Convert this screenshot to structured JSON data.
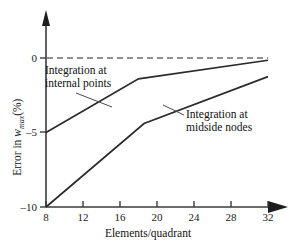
{
  "chart_data": {
    "type": "line",
    "title": "",
    "xlabel": "Elements/quadrant",
    "ylabel": "Error in w_max (%)",
    "xlim": [
      8,
      32
    ],
    "ylim": [
      -10,
      0.6
    ],
    "grid": false,
    "legend": "annotations",
    "x_ticks": [
      8,
      12,
      16,
      20,
      24,
      28,
      32
    ],
    "x_tick_labels": [
      "8",
      "12",
      "16",
      "20",
      "24",
      "28",
      "32"
    ],
    "y_ticks": [
      0,
      -5,
      -10
    ],
    "y_tick_labels": [
      "0",
      "–5",
      "–10"
    ],
    "reference_line": {
      "name": "zero-error-line",
      "y": 0,
      "style": "dashed",
      "x_from": 8,
      "x_to": 32
    },
    "series": [
      {
        "name": "Integration at internal points",
        "x": [
          8,
          18,
          32
        ],
        "y": [
          -5.0,
          -1.4,
          -0.15
        ]
      },
      {
        "name": "Integration at midside nodes",
        "x": [
          8,
          18.6,
          32
        ],
        "y": [
          -10.0,
          -4.4,
          -1.25
        ]
      }
    ],
    "annotations": [
      {
        "name": "annotation-internal-points",
        "line1": "Integration at",
        "line2": "internal points",
        "points_to_series": "Integration at internal points"
      },
      {
        "name": "annotation-midside-nodes",
        "line1": "Integration at",
        "line2": "midside nodes",
        "points_to_series": "Integration at midside nodes"
      }
    ]
  },
  "axes": {
    "x_title": "Elements/quadrant",
    "y_title_prefix": "Error in ",
    "y_title_var": "w",
    "y_title_sub": "max",
    "y_title_suffix": "(%)",
    "x_tick_labels": {
      "t0": "8",
      "t1": "12",
      "t2": "16",
      "t3": "20",
      "t4": "24",
      "t5": "28",
      "t6": "32"
    },
    "y_tick_labels": {
      "t0": "0",
      "t1": "–5",
      "t2": "–10"
    }
  },
  "annotations": {
    "internal": {
      "line1": "Integration at",
      "line2": "internal points"
    },
    "midside": {
      "line1": "Integration at",
      "line2": "midside nodes"
    }
  },
  "colors": {
    "curve": "#2b2b2b",
    "axis": "#3a3a3a",
    "dashed": "#6b6b6b",
    "text": "#111111",
    "background": "#ffffff"
  }
}
